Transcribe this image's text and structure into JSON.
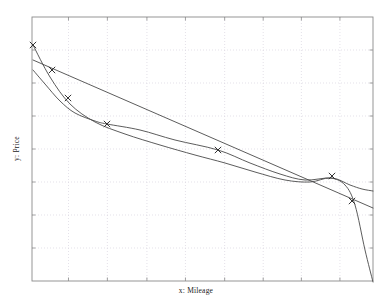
{
  "chart_data": {
    "type": "line",
    "title": "",
    "xlabel": "x: Mileage",
    "ylabel": "y: Price",
    "grid": true,
    "legend": "none",
    "xlim": [
      0,
      1
    ],
    "ylim": [
      0,
      1
    ],
    "x_ticks": [
      0.107,
      0.221,
      0.337,
      0.45,
      0.565,
      0.678,
      0.79,
      0.903
    ],
    "y_ticks": [
      0.125,
      0.25,
      0.375,
      0.5,
      0.625,
      0.75,
      0.875
    ],
    "marker": "x",
    "points": {
      "name": "Observed data",
      "x": [
        0.003,
        0.059,
        0.106,
        0.22,
        0.546,
        0.88,
        0.939
      ],
      "y": [
        0.894,
        0.799,
        0.693,
        0.595,
        0.496,
        0.398,
        0.303
      ],
      "px": [
        33,
        52,
        68,
        107,
        218,
        332,
        352
      ],
      "py": [
        45,
        70,
        98,
        124,
        150,
        176,
        201
      ]
    },
    "series": [
      {
        "name": "Linear fit",
        "style": "solid",
        "px": [
          33,
          373
        ],
        "py": [
          60,
          208
        ]
      },
      {
        "name": "Smoothing spline",
        "style": "solid",
        "px": [
          33,
          45,
          60,
          75,
          95,
          107,
          140,
          175,
          218,
          250,
          280,
          305,
          332,
          350,
          362,
          373
        ],
        "py": [
          70,
          84,
          101,
          113,
          121,
          124,
          130,
          140,
          150,
          163,
          174,
          180,
          178,
          185,
          189,
          191
        ]
      },
      {
        "name": "Polynomial fit",
        "style": "solid",
        "px": [
          33,
          50,
          70,
          95,
          125,
          160,
          195,
          225,
          255,
          285,
          310,
          330,
          345,
          355,
          365,
          373
        ],
        "py": [
          45,
          77,
          104,
          122,
          134,
          145,
          155,
          163,
          172,
          180,
          182,
          178,
          185,
          205,
          250,
          282
        ]
      }
    ]
  },
  "plot": {
    "frame": {
      "left": 32,
      "top": 17,
      "right": 373,
      "bottom": 281
    },
    "colors": {
      "frame": "#8a8a8a",
      "grid": "#d9d4e0",
      "curve": "#4a4a4a",
      "marker": "#333333",
      "text": "#1a1a1a",
      "background": "#ffffff"
    }
  }
}
